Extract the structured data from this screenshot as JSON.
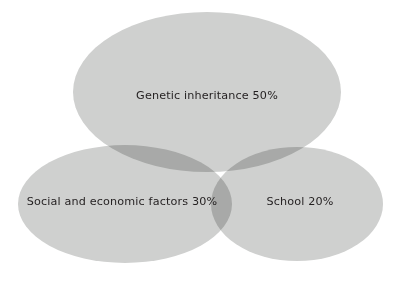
{
  "diagram": {
    "type": "venn",
    "set_count": 3,
    "background_color": "#ffffff",
    "ellipse_fill_color": "#cfd0cf",
    "overlap_fill_color": "#a8a9a8",
    "label_text_color": "#231f20",
    "sets": [
      {
        "id": "genetic",
        "label": "Genetic inheritance 50%",
        "name": "Genetic inheritance",
        "value": 50,
        "unit": "%",
        "position": "top-center",
        "cx": 207,
        "cy": 92,
        "rx": 134,
        "ry": 80,
        "label_x": 207,
        "label_y": 96
      },
      {
        "id": "social",
        "label": "Social and economic factors 30%",
        "name": "Social and economic factors",
        "value": 30,
        "unit": "%",
        "position": "bottom-left",
        "cx": 125,
        "cy": 204,
        "rx": 107,
        "ry": 59,
        "label_x": 122,
        "label_y": 202
      },
      {
        "id": "school",
        "label": "School 20%",
        "name": "School",
        "value": 20,
        "unit": "%",
        "position": "bottom-right",
        "cx": 297,
        "cy": 204,
        "rx": 86,
        "ry": 57,
        "label_x": 300,
        "label_y": 202
      }
    ]
  }
}
